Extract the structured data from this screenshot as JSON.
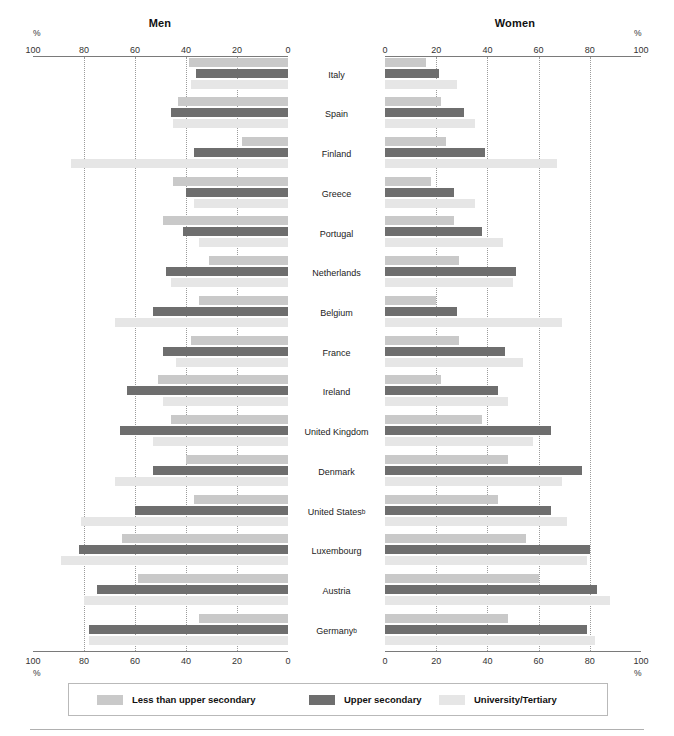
{
  "panels": {
    "men": {
      "title": "Men",
      "pct_symbol": "%"
    },
    "women": {
      "title": "Women",
      "pct_symbol": "%"
    }
  },
  "legend": {
    "items": [
      {
        "label": "Less than upper secondary",
        "color": "#c9c9c9"
      },
      {
        "label": "Upper secondary",
        "color": "#6e6e6e"
      },
      {
        "label": "University/Tertiary",
        "color": "#e6e6e6"
      }
    ]
  },
  "chart_data": {
    "type": "bar",
    "xlabel": "%",
    "ylabel": "",
    "orientation": "horizontal",
    "layout": "back-to-back paired panels (Men mirrored left, Women right)",
    "grid": "vertical dotted gridlines at 20, 40, 60, 80",
    "xlim": [
      0,
      100
    ],
    "axis_ticks": [
      0,
      20,
      40,
      60,
      80,
      100
    ],
    "men_tick_labels": [
      "100",
      "80",
      "60",
      "40",
      "20",
      "0"
    ],
    "women_tick_labels": [
      "0",
      "20",
      "40",
      "60",
      "80",
      "100"
    ],
    "legend_position": "bottom",
    "categories": [
      "Italy",
      "Spain",
      "Finland",
      "Greece",
      "Portugal",
      "Netherlands",
      "Belgium",
      "France",
      "Ireland",
      "United Kingdom",
      "Denmark",
      "United States",
      "Luxembourg",
      "Austria",
      "Germany"
    ],
    "category_notes": {
      "United States": "b",
      "Germany": "b"
    },
    "series": [
      {
        "name": "Less than upper secondary",
        "color": "#c9c9c9",
        "men": [
          39,
          43,
          18,
          45,
          49,
          31,
          35,
          38,
          51,
          46,
          40,
          37,
          65,
          59,
          35
        ],
        "women": [
          16,
          22,
          24,
          18,
          27,
          29,
          20,
          29,
          22,
          38,
          48,
          44,
          55,
          60,
          48
        ]
      },
      {
        "name": "Upper secondary",
        "color": "#6e6e6e",
        "men": [
          36,
          46,
          37,
          40,
          41,
          48,
          53,
          49,
          63,
          66,
          53,
          60,
          82,
          75,
          78
        ],
        "women": [
          21,
          31,
          39,
          27,
          38,
          51,
          28,
          47,
          44,
          65,
          77,
          65,
          80,
          83,
          79
        ]
      },
      {
        "name": "University/Tertiary",
        "color": "#e6e6e6",
        "men": [
          38,
          45,
          85,
          37,
          35,
          46,
          68,
          44,
          49,
          53,
          68,
          81,
          89,
          80,
          78
        ],
        "women": [
          28,
          35,
          67,
          35,
          46,
          50,
          69,
          54,
          48,
          58,
          69,
          71,
          79,
          88,
          82
        ]
      }
    ]
  }
}
